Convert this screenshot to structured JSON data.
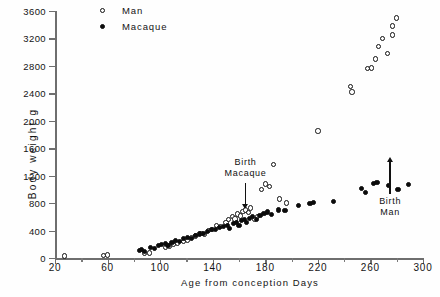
{
  "chart_data": {
    "type": "scatter",
    "title": "",
    "xlabel": "Age from conception    Days",
    "ylabel": "Body  weight  g",
    "xlim": [
      20,
      300
    ],
    "ylim": [
      0,
      3600
    ],
    "grid": false,
    "legend_position": "top-left",
    "xticks": [
      20,
      60,
      100,
      140,
      180,
      220,
      260,
      300
    ],
    "xtick_labels": [
      "20",
      "60",
      "100",
      "140",
      "180",
      "220",
      "260",
      "300"
    ],
    "xminor_ticks": [
      40,
      80,
      120,
      160,
      200,
      240,
      280
    ],
    "yticks": [
      0,
      400,
      800,
      1200,
      1600,
      2000,
      2400,
      2800,
      3200,
      3600
    ],
    "ytick_labels": [
      "0",
      "400",
      "800",
      "1200",
      "1600",
      "2000",
      "2400",
      "2800",
      "3200",
      "3600"
    ],
    "series": [
      {
        "name": "Man",
        "marker": "open-circle",
        "color": "#111111",
        "points": [
          [
            27,
            30
          ],
          [
            57,
            40
          ],
          [
            60,
            45
          ],
          [
            88,
            70
          ],
          [
            92,
            75
          ],
          [
            104,
            150
          ],
          [
            107,
            175
          ],
          [
            110,
            200
          ],
          [
            113,
            210
          ],
          [
            118,
            245
          ],
          [
            121,
            255
          ],
          [
            124,
            300
          ],
          [
            127,
            320
          ],
          [
            131,
            360
          ],
          [
            134,
            340
          ],
          [
            137,
            400
          ],
          [
            140,
            420
          ],
          [
            143,
            470
          ],
          [
            146,
            455
          ],
          [
            150,
            520
          ],
          [
            152,
            560
          ],
          [
            155,
            600
          ],
          [
            157,
            570
          ],
          [
            159,
            640
          ],
          [
            161,
            610
          ],
          [
            163,
            680
          ],
          [
            165,
            700
          ],
          [
            167,
            660
          ],
          [
            169,
            730
          ],
          [
            172,
            560
          ],
          [
            174,
            600
          ],
          [
            177,
            1000
          ],
          [
            180,
            1080
          ],
          [
            183,
            1040
          ],
          [
            186,
            1360
          ],
          [
            191,
            860
          ],
          [
            196,
            800
          ],
          [
            220,
            1850
          ],
          [
            245,
            2500
          ],
          [
            246,
            2420
          ],
          [
            258,
            2760
          ],
          [
            261,
            2770
          ],
          [
            264,
            2900
          ],
          [
            266,
            3080
          ],
          [
            269,
            3200
          ],
          [
            273,
            2980
          ],
          [
            277,
            3380
          ],
          [
            277,
            3250
          ],
          [
            280,
            3500
          ]
        ]
      },
      {
        "name": "Macaque",
        "marker": "filled-circle",
        "color": "#0b0b0b",
        "points": [
          [
            84,
            110
          ],
          [
            86,
            120
          ],
          [
            88,
            95
          ],
          [
            93,
            150
          ],
          [
            96,
            140
          ],
          [
            99,
            185
          ],
          [
            101,
            195
          ],
          [
            104,
            210
          ],
          [
            106,
            185
          ],
          [
            109,
            230
          ],
          [
            112,
            250
          ],
          [
            115,
            240
          ],
          [
            118,
            290
          ],
          [
            121,
            300
          ],
          [
            124,
            280
          ],
          [
            127,
            330
          ],
          [
            130,
            350
          ],
          [
            133,
            360
          ],
          [
            136,
            390
          ],
          [
            139,
            410
          ],
          [
            142,
            420
          ],
          [
            145,
            440
          ],
          [
            148,
            460
          ],
          [
            151,
            480
          ],
          [
            153,
            430
          ],
          [
            156,
            500
          ],
          [
            158,
            520
          ],
          [
            160,
            470
          ],
          [
            162,
            540
          ],
          [
            164,
            560
          ],
          [
            166,
            520
          ],
          [
            168,
            580
          ],
          [
            170,
            600
          ],
          [
            173,
            560
          ],
          [
            176,
            620
          ],
          [
            179,
            650
          ],
          [
            182,
            670
          ],
          [
            185,
            640
          ],
          [
            190,
            700
          ],
          [
            195,
            690
          ],
          [
            205,
            760
          ],
          [
            214,
            800
          ],
          [
            217,
            810
          ],
          [
            232,
            830
          ],
          [
            253,
            1010
          ],
          [
            256,
            950
          ],
          [
            262,
            1090
          ],
          [
            265,
            1095
          ],
          [
            274,
            1060
          ],
          [
            281,
            1000
          ],
          [
            289,
            1070
          ]
        ]
      }
    ],
    "annotations": [
      {
        "text_line1": "Birth",
        "text_line2": "Macaque",
        "x": 165,
        "arrow": "down"
      },
      {
        "text_line1": "Birth",
        "text_line2": "Man",
        "x": 275,
        "arrow": "up"
      }
    ]
  },
  "legend": {
    "items": [
      {
        "label": "Man",
        "marker": "open-circle"
      },
      {
        "label": "Macaque",
        "marker": "filled-circle"
      }
    ]
  }
}
